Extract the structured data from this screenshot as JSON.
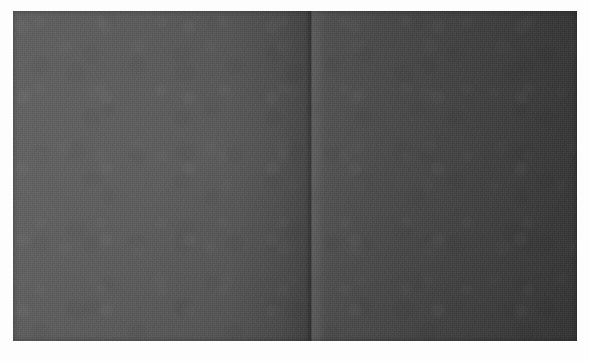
{
  "scene": {
    "title": "Blank dark two-page spread",
    "description": "Photograph of a blank dark grey folded sheet or open spread on a white ground. No text, icons or controls are visible.",
    "canvas": {
      "width_px": 589,
      "height_px": 361,
      "background_color": "#fdfdfd"
    },
    "surface": {
      "name": "dark-spread",
      "left_px": 13,
      "top_px": 11,
      "width_px": 564,
      "height_px": 330,
      "base_color": "#4b4b4b",
      "text_content": ""
    },
    "panels": [
      {
        "name": "left-leaf",
        "position": "left",
        "left_px": 0,
        "width_px": 298,
        "color_start": "#5f5f5f",
        "color_end": "#3c3c3c",
        "gradient_direction": "to right",
        "text_content": ""
      },
      {
        "name": "right-leaf",
        "position": "right",
        "left_px": 298,
        "width_px": 266,
        "color_start": "#4e4e4e",
        "color_end": "#343434",
        "gradient_direction": "to right",
        "text_content": ""
      }
    ],
    "gutter": {
      "name": "center-fold",
      "x_px": 297,
      "width_px": 6,
      "shadow_color": "#000000",
      "highlight_color": "#ffffff",
      "text_content": ""
    },
    "texture": {
      "type": "photographic-grain",
      "grain_opacity": 0.5,
      "mottle_opacity": 0.33,
      "vignette": true
    }
  },
  "content": {
    "visible_text": [],
    "visible_icons": [],
    "visible_controls": [],
    "note": ""
  }
}
